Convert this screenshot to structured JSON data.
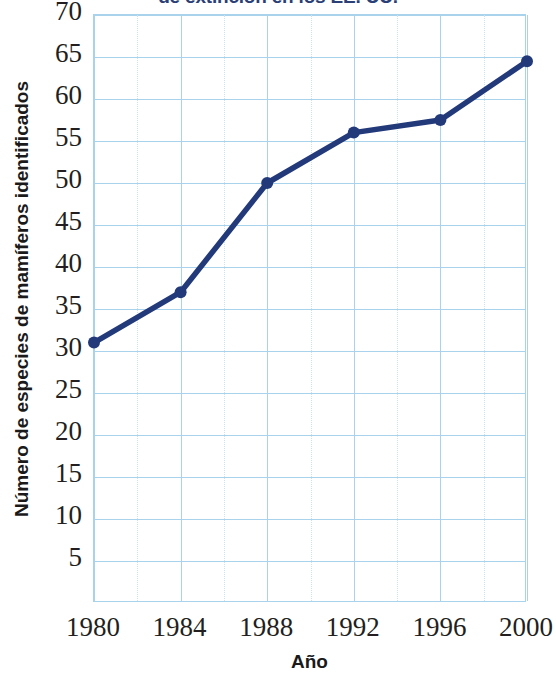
{
  "chart_data": {
    "type": "line",
    "title": "de extinción en los EE. UU.",
    "title_note": "top of title is cropped off the top edge of the image",
    "xlabel": "Año",
    "ylabel": "Número de especies de mamíferos identificados",
    "x": [
      1980,
      1984,
      1988,
      1992,
      1996,
      2000
    ],
    "categories": [
      "1980",
      "1984",
      "1988",
      "1992",
      "1996",
      "2000"
    ],
    "values": [
      31,
      37,
      50,
      56,
      57.5,
      64.5
    ],
    "series": [
      {
        "name": "Número de especies de mamíferos identificados",
        "values": [
          31,
          37,
          50,
          56,
          57.5,
          64.5
        ]
      }
    ],
    "xlim": [
      1980,
      2000
    ],
    "ylim": [
      0,
      70
    ],
    "ytick_labels": [
      "70",
      "65",
      "60",
      "55",
      "50",
      "45",
      "40",
      "35",
      "30",
      "25",
      "20",
      "15",
      "10",
      "5"
    ],
    "ytick_values": [
      70,
      65,
      60,
      55,
      50,
      45,
      40,
      35,
      30,
      25,
      20,
      15,
      10,
      5
    ],
    "xtick_labels": [
      "1980",
      "1984",
      "1988",
      "1992",
      "1996",
      "2000"
    ],
    "xtick_values": [
      1980,
      1984,
      1988,
      1992,
      1996,
      2000
    ],
    "x_minor_step": 2,
    "y_step": 5,
    "grid": true,
    "legend": "none",
    "colors": {
      "line": "#22397a",
      "marker": "#22397a",
      "grid": "#a9d2ec",
      "grid_minor": "#c9e3f4",
      "title": "#2b3f77",
      "axis_text": "#231f20",
      "background": "#ffffff"
    }
  }
}
